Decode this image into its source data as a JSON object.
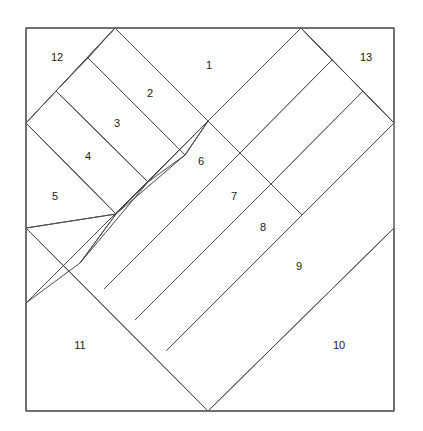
{
  "figure": {
    "name": "chevron-quilt-block-piecing-diagram",
    "background_color": "#ffffff",
    "line_color": "#4a4a4a",
    "frame_color": "#6b6b6b",
    "label_color": "#1a1a1a",
    "frame": {
      "x": 26,
      "y": 28,
      "width": 368,
      "height": 383
    }
  },
  "pieces": [
    {
      "number": "1",
      "label_x": 209,
      "label_y": 66,
      "points": "115,28 208,121 301,28"
    },
    {
      "number": "2",
      "label_x": 150,
      "label_y": 94,
      "points": "115,28 88,58 185,155 208,121"
    },
    {
      "number": "3",
      "label_x": 117,
      "label_y": 124,
      "points": "88,58 56,91 148,182 185,155"
    },
    {
      "number": "4",
      "label_x": 88,
      "label_y": 157,
      "points": "56,91 26,123 116,214 148,182"
    },
    {
      "number": "5",
      "label_x": 55,
      "label_y": 197,
      "points": "26,123 26,228 116,214"
    },
    {
      "number": "6",
      "label_x": 201,
      "label_y": 162,
      "points": "208,121 185,155 116,214 80,263 148,182"
    },
    {
      "number": "7",
      "label_x": 234,
      "label_y": 197,
      "points": "208,121 301,28 332,60 240,153"
    },
    {
      "number": "8",
      "label_x": 263,
      "label_y": 228,
      "points": "332,60 363,91 271,184 240,153"
    },
    {
      "number": "9",
      "label_x": 299,
      "label_y": 267,
      "points": "363,91 394,123 302,215 271,184"
    },
    {
      "number": "10",
      "label_x": 339,
      "label_y": 346,
      "points": "394,228 394,411 208,411"
    },
    {
      "number": "11",
      "label_x": 80,
      "label_y": 346,
      "points": "26,228 208,411 26,411"
    },
    {
      "number": "12",
      "label_x": 57,
      "label_y": 58,
      "points": "26,28 115,28 26,123"
    },
    {
      "number": "13",
      "label_x": 366,
      "label_y": 58,
      "points": "301,28 394,28 394,123"
    }
  ],
  "edges": [
    {
      "name": "frame-top",
      "x1": 26,
      "y1": 28,
      "x2": 394,
      "y2": 28
    },
    {
      "name": "frame-right",
      "x1": 394,
      "y1": 28,
      "x2": 394,
      "y2": 411
    },
    {
      "name": "frame-bottom",
      "x1": 394,
      "y1": 411,
      "x2": 26,
      "y2": 411
    },
    {
      "name": "frame-left",
      "x1": 26,
      "y1": 411,
      "x2": 26,
      "y2": 28
    },
    {
      "name": "chevron-left-outer",
      "x1": 115,
      "y1": 28,
      "x2": 26,
      "y2": 123
    },
    {
      "name": "chevron-right-outer",
      "x1": 301,
      "y1": 28,
      "x2": 394,
      "y2": 123
    },
    {
      "name": "apex-left-inner",
      "x1": 115,
      "y1": 28,
      "x2": 208,
      "y2": 121
    },
    {
      "name": "apex-right-inner",
      "x1": 301,
      "y1": 28,
      "x2": 208,
      "y2": 121
    },
    {
      "name": "strip2-upper",
      "x1": 88,
      "y1": 58,
      "x2": 185,
      "y2": 155
    },
    {
      "name": "strip3-upper",
      "x1": 56,
      "y1": 91,
      "x2": 148,
      "y2": 182
    },
    {
      "name": "strip4-upper",
      "x1": 26,
      "y1": 123,
      "x2": 116,
      "y2": 214
    },
    {
      "name": "strip2-lower",
      "x1": 185,
      "y1": 155,
      "x2": 208,
      "y2": 121
    },
    {
      "name": "strip3-lower",
      "x1": 148,
      "y1": 182,
      "x2": 185,
      "y2": 155
    },
    {
      "name": "strip4-lower",
      "x1": 116,
      "y1": 214,
      "x2": 148,
      "y2": 182
    },
    {
      "name": "piece5-lower-edge",
      "x1": 26,
      "y1": 228,
      "x2": 116,
      "y2": 214
    },
    {
      "name": "piece6-inner-left",
      "x1": 116,
      "y1": 214,
      "x2": 80,
      "y2": 263
    },
    {
      "name": "strip6-7-divider",
      "x1": 208,
      "y1": 121,
      "x2": 26,
      "y2": 303
    },
    {
      "name": "strip7-8-divider",
      "x1": 240,
      "y1": 153,
      "x2": 104,
      "y2": 289
    },
    {
      "name": "strip8-9-divider",
      "x1": 271,
      "y1": 184,
      "x2": 135,
      "y2": 320
    },
    {
      "name": "strip9-10-divider",
      "x1": 302,
      "y1": 215,
      "x2": 166,
      "y2": 351
    },
    {
      "name": "strip6-left-return",
      "x1": 80,
      "y1": 263,
      "x2": 26,
      "y2": 303
    },
    {
      "name": "strip7-right-edge",
      "x1": 301,
      "y1": 28,
      "x2": 332,
      "y2": 60
    },
    {
      "name": "strip8-right-edge",
      "x1": 332,
      "y1": 60,
      "x2": 363,
      "y2": 91
    },
    {
      "name": "strip9-right-edge",
      "x1": 363,
      "y1": 91,
      "x2": 394,
      "y2": 123
    },
    {
      "name": "chevron-v-left",
      "x1": 26,
      "y1": 228,
      "x2": 208,
      "y2": 411
    },
    {
      "name": "chevron-v-right",
      "x1": 208,
      "y1": 411,
      "x2": 394,
      "y2": 228
    }
  ]
}
